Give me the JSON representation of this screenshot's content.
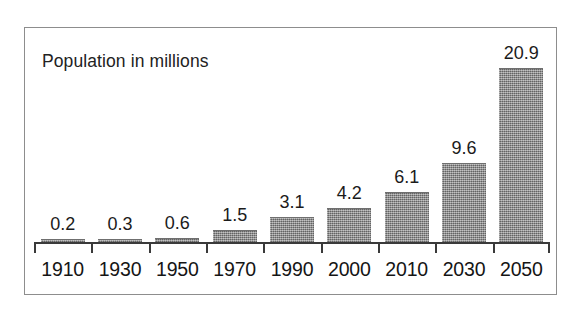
{
  "chart_data": {
    "type": "bar",
    "title": "Population in millions",
    "xlabel": "",
    "ylabel": "",
    "categories": [
      "1910",
      "1930",
      "1950",
      "1970",
      "1990",
      "2000",
      "2010",
      "2030",
      "2050"
    ],
    "values": [
      0.2,
      0.3,
      0.6,
      1.5,
      3.1,
      4.2,
      6.1,
      9.6,
      20.9
    ],
    "value_labels": [
      "0.2",
      "0.3",
      "0.6",
      "1.5",
      "3.1",
      "4.2",
      "6.1",
      "9.6",
      "20.9"
    ],
    "ylim": [
      0,
      20.9
    ],
    "grid": false,
    "legend": null,
    "bar_color": "#8a8a8a",
    "frame_color": "#8d8d8d",
    "axis_color": "#3a3a3a",
    "text_color": "#1a1a1a"
  }
}
